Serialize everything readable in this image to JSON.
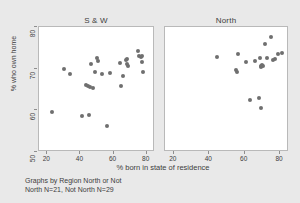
{
  "figure": {
    "background_color": "#e9e9e9",
    "panel_background_color": "#ffffff",
    "marker_color": "#6f6f6f",
    "axis_color": "#8e8e8e",
    "text_color": "#3d3d3d",
    "xaxis_title": "% born in state of residence",
    "yaxis_title": "% who own home",
    "note_line1": "Graphs by Region North or Not",
    "note_line2": "North N=21, Not North N=29"
  },
  "chart_data": {
    "type": "scatter",
    "title": "",
    "xlabel": "% born in state of residence",
    "ylabel": "% who own home",
    "xlim": [
      15,
      85
    ],
    "ylim": [
      50,
      80
    ],
    "xticks": [
      20,
      40,
      60,
      80
    ],
    "yticks": [
      50,
      60,
      70,
      80
    ],
    "grid": false,
    "legend": "none",
    "panels": [
      {
        "name": "S & W",
        "n": 29,
        "points": [
          {
            "x": 23.5,
            "y": 59.4
          },
          {
            "x": 30.5,
            "y": 69.8
          },
          {
            "x": 34.5,
            "y": 68.5
          },
          {
            "x": 41.5,
            "y": 58.3
          },
          {
            "x": 44.0,
            "y": 65.8
          },
          {
            "x": 45.0,
            "y": 65.6
          },
          {
            "x": 45.5,
            "y": 58.6
          },
          {
            "x": 46.5,
            "y": 65.4
          },
          {
            "x": 47.0,
            "y": 70.8
          },
          {
            "x": 48.0,
            "y": 65.2
          },
          {
            "x": 49.5,
            "y": 68.9
          },
          {
            "x": 50.5,
            "y": 72.4
          },
          {
            "x": 51.0,
            "y": 71.6
          },
          {
            "x": 53.5,
            "y": 68.4
          },
          {
            "x": 56.5,
            "y": 56.1
          },
          {
            "x": 58.5,
            "y": 68.8
          },
          {
            "x": 64.5,
            "y": 71.2
          },
          {
            "x": 65.0,
            "y": 65.6
          },
          {
            "x": 66.0,
            "y": 68.0
          },
          {
            "x": 68.0,
            "y": 71.8
          },
          {
            "x": 68.5,
            "y": 72.2
          },
          {
            "x": 69.0,
            "y": 71.0
          },
          {
            "x": 69.5,
            "y": 70.4
          },
          {
            "x": 75.5,
            "y": 74.0
          },
          {
            "x": 76.0,
            "y": 72.8
          },
          {
            "x": 77.0,
            "y": 72.6
          },
          {
            "x": 77.5,
            "y": 71.3
          },
          {
            "x": 78.5,
            "y": 68.9
          },
          {
            "x": 78.0,
            "y": 72.9
          }
        ]
      },
      {
        "name": "North",
        "n": 21,
        "points": [
          {
            "x": 45.0,
            "y": 72.6
          },
          {
            "x": 55.5,
            "y": 69.5
          },
          {
            "x": 56.0,
            "y": 69.0
          },
          {
            "x": 56.5,
            "y": 73.2
          },
          {
            "x": 61.5,
            "y": 71.4
          },
          {
            "x": 63.5,
            "y": 62.2
          },
          {
            "x": 66.5,
            "y": 71.6
          },
          {
            "x": 68.5,
            "y": 62.8
          },
          {
            "x": 69.0,
            "y": 72.3
          },
          {
            "x": 69.5,
            "y": 70.5
          },
          {
            "x": 70.0,
            "y": 70.2
          },
          {
            "x": 70.5,
            "y": 70.6
          },
          {
            "x": 70.0,
            "y": 60.3
          },
          {
            "x": 71.0,
            "y": 70.3
          },
          {
            "x": 72.0,
            "y": 75.6
          },
          {
            "x": 73.0,
            "y": 72.4
          },
          {
            "x": 75.5,
            "y": 77.4
          },
          {
            "x": 76.5,
            "y": 71.9
          },
          {
            "x": 77.5,
            "y": 72.2
          },
          {
            "x": 79.5,
            "y": 73.4
          },
          {
            "x": 81.5,
            "y": 73.6
          }
        ]
      }
    ]
  }
}
